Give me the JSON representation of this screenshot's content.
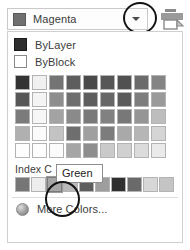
{
  "combobox": {
    "selected_label": "Magenta",
    "selected_swatch": "#707070",
    "arrow_icon": "chevron-down-icon"
  },
  "toolbar": {
    "icon": "print-preview-icon"
  },
  "annotations": [
    {
      "name": "dropdown-arrow-highlight",
      "shape": "ellipse"
    },
    {
      "name": "index-swatch-highlight",
      "shape": "ellipse"
    }
  ],
  "tooltip": {
    "text": "Green"
  },
  "dropdown": {
    "named_colors": [
      {
        "label": "ByLayer",
        "swatch": "#2e2e2e",
        "border": "#1a1a1a"
      },
      {
        "label": "ByBlock",
        "swatch": "#ffffff",
        "border": "#8a8a8a"
      }
    ],
    "index_section_label": "Index C",
    "more_colors_label": "More Colors...",
    "more_colors_icon": "globe-icon",
    "color_grid": {
      "columns": 9,
      "rows": 5,
      "cells": [
        [
          "#333333",
          "#f1f1f1",
          "#747474",
          "#5d5d5d",
          "#4a4a4a",
          "#565656",
          "#515151",
          "#6b6b6b",
          "#848484"
        ],
        [
          "#575757",
          "#f4f4f4",
          "#8d8d8d",
          "#6f6f6f",
          "#5e5e5e",
          "#666666",
          "#5b5b5b",
          "#7d7d7d",
          "#9a9a9a"
        ],
        [
          "#7b7b7b",
          "#f7f7f7",
          "#a3a3a3",
          "#8a8a8a",
          "#7a7a7a",
          "#818181",
          "#787878",
          "#959595",
          "#bdbdbd"
        ],
        [
          "#b0b0b0",
          "#fbfbfb",
          "#c3c3c3",
          "#6e6e6e",
          "#a0a0a0",
          "#7c7c7c",
          "#a9a9a9",
          "#b6b6b6",
          "#d5d5d5"
        ],
        [
          "#fdfdfd",
          "#fdfdfd",
          "#fbfbfb",
          "#a5a5a5",
          "#8e8e8e",
          "#cacaca",
          "#d0d0d0",
          "#dcdcdc",
          "#eaeaea"
        ]
      ]
    },
    "index_row": {
      "swatches": [
        "#767676",
        "#ededed",
        "#a6a6a6",
        "#b9b9b9",
        "#5e5e5e",
        "#9e9e9e",
        "#2f2f2f",
        "#6a6a6a",
        "#d7d7d7",
        "#c4c4c4"
      ],
      "selected_index": 2
    }
  }
}
